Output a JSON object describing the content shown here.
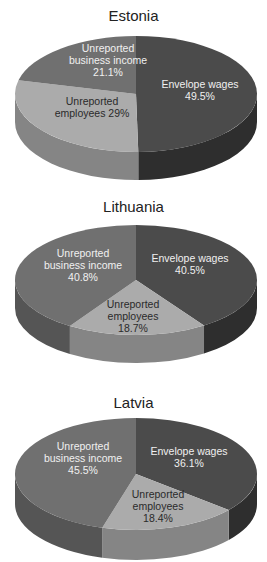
{
  "colors": {
    "envelope_top": "#4b4b4b",
    "envelope_side": "#2e2e2e",
    "business_top": "#707070",
    "business_side": "#555555",
    "employees_top": "#ababab",
    "employees_side": "#858585"
  },
  "chart_data": [
    {
      "type": "pie",
      "title": "Estonia",
      "categories": [
        "Envelope wages",
        "Unreported employees",
        "Unreported business income"
      ],
      "values": [
        49.5,
        29,
        21.1
      ],
      "labels": [
        "Envelope wages\n49.5%",
        "Unreported\nemployees 29%",
        "Unreported\nbusiness income\n21.1%"
      ]
    },
    {
      "type": "pie",
      "title": "Lithuania",
      "categories": [
        "Envelope wages",
        "Unreported employees",
        "Unreported business income"
      ],
      "values": [
        40.5,
        18.7,
        40.8
      ],
      "labels": [
        "Envelope wages\n40.5%",
        "Unreported\nemployees\n18.7%",
        "Unreported\nbusiness income\n40.8%"
      ]
    },
    {
      "type": "pie",
      "title": "Latvia",
      "categories": [
        "Envelope wages",
        "Unreported employees",
        "Unreported business income"
      ],
      "values": [
        36.1,
        18.4,
        45.5
      ],
      "labels": [
        "Envelope wages\n36.1%",
        "Unreported\nemployees\n18.4%",
        "Unreported\nbusiness income\n45.5%"
      ]
    }
  ]
}
